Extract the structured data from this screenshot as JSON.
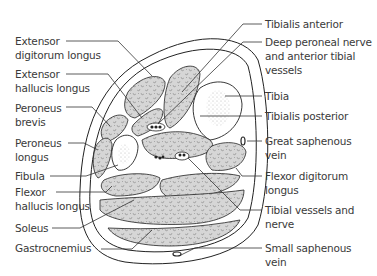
{
  "diagram": {
    "left_labels": [
      {
        "id": "edl",
        "text": "Extensor\ndigitorum longus"
      },
      {
        "id": "ehl",
        "text": "Extensor\nhallucis longus"
      },
      {
        "id": "pb",
        "text": "Peroneus\nbrevis"
      },
      {
        "id": "pl",
        "text": "Peroneus\nlongus"
      },
      {
        "id": "fib",
        "text": "Fibula"
      },
      {
        "id": "fhl",
        "text": "Flexor\nhallucis longus"
      },
      {
        "id": "sol",
        "text": "Soleus"
      },
      {
        "id": "gas",
        "text": "Gastrocnemius"
      }
    ],
    "right_labels": [
      {
        "id": "ta",
        "text": "Tibialis anterior"
      },
      {
        "id": "dpn",
        "text": "Deep peroneal nerve\nand anterior tibial\nvessels"
      },
      {
        "id": "tib",
        "text": "Tibia"
      },
      {
        "id": "tp",
        "text": "Tibialis posterior"
      },
      {
        "id": "gsv",
        "text": "Great saphenous\nvein"
      },
      {
        "id": "fdl",
        "text": "Flexor digitorum\nlongus"
      },
      {
        "id": "tvn",
        "text": "Tibial vessels and\nnerve"
      },
      {
        "id": "ssv",
        "text": "Small saphenous\nvein"
      }
    ],
    "colors": {
      "muscle_fill": "#d4d4d4",
      "outline": "#222222",
      "bone_fill": "#ffffff",
      "text": "#3a3a3a"
    }
  }
}
